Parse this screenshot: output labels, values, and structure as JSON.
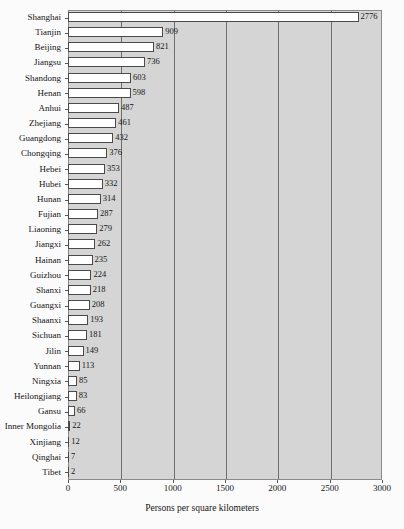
{
  "chart_data": {
    "type": "bar",
    "orientation": "horizontal",
    "title": "",
    "subtitle": "",
    "xlabel": "Persons per square kilometers",
    "ylabel": "",
    "xlim": [
      0,
      3000
    ],
    "xticks": [
      0,
      500,
      1000,
      1500,
      2000,
      2500,
      3000
    ],
    "xtick_labels": [
      "0",
      "500",
      "1000",
      "1500",
      "2000",
      "2500",
      "3000"
    ],
    "grid": true,
    "grid_axis": "x",
    "legend": false,
    "legend_position": "none",
    "data_labels": true,
    "categories": [
      "Shanghai",
      "Tianjin",
      "Beijing",
      "Jiangsu",
      "Shandong",
      "Henan",
      "Anhui",
      "Zhejiang",
      "Guangdong",
      "Chongqing",
      "Hebei",
      "Hubei",
      "Hunan",
      "Fujian",
      "Liaoning",
      "Jiangxi",
      "Hainan",
      "Guizhou",
      "Shanxi",
      "Guangxi",
      "Shaanxi",
      "Sichuan",
      "Jilin",
      "Yunnan",
      "Ningxia",
      "Heilongjiang",
      "Gansu",
      "Inner Mongolia",
      "Xinjiang",
      "Qinghai",
      "Tibet"
    ],
    "values": [
      2776,
      909,
      821,
      736,
      603,
      598,
      487,
      461,
      432,
      376,
      353,
      332,
      314,
      287,
      279,
      262,
      235,
      224,
      218,
      208,
      193,
      181,
      149,
      113,
      85,
      83,
      66,
      22,
      12,
      7,
      2
    ],
    "colors": {
      "bar_fill": "#ffffff",
      "bar_edge": "#4a4a4a",
      "plot_background": "#d5d5d5",
      "figure_background": "#fbfbfb",
      "gridline": "#6f6f6f",
      "text": "#151515"
    }
  }
}
